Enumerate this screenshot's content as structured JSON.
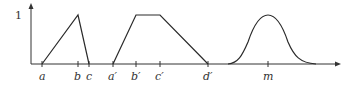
{
  "diagram": {
    "y_label": "1",
    "x_labels": [
      {
        "id": "a",
        "text": "a",
        "x": 42
      },
      {
        "id": "b",
        "text": "b",
        "x": 78
      },
      {
        "id": "c",
        "text": "c",
        "x": 89
      },
      {
        "id": "a_prime",
        "text": "a′",
        "x": 113
      },
      {
        "id": "b_prime",
        "text": "b′",
        "x": 136
      },
      {
        "id": "c_prime",
        "text": "c′",
        "x": 160
      },
      {
        "id": "d_prime",
        "text": "d′",
        "x": 208
      },
      {
        "id": "m",
        "text": "m",
        "x": 268
      }
    ],
    "shapes": [
      {
        "type": "triangle",
        "name": "triangular membership function",
        "points": [
          "a",
          "b",
          "c"
        ]
      },
      {
        "type": "trapezoid",
        "name": "trapezoidal membership function",
        "points": [
          "a′",
          "b′",
          "c′",
          "d′"
        ]
      },
      {
        "type": "gaussian",
        "name": "bell-shaped membership function",
        "center": "m"
      }
    ],
    "line_color": "#2a2a2a"
  }
}
